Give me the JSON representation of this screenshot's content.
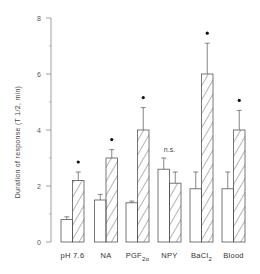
{
  "chart_data": {
    "type": "bar",
    "title": "",
    "xlabel": "",
    "ylabel": "Duration of response (T 1/2, min)",
    "ylim": [
      0,
      8
    ],
    "yticks": [
      0,
      2,
      4,
      6,
      8
    ],
    "grid": false,
    "legend": null,
    "categories": [
      "pH 7.6",
      "NA",
      "PGF2α",
      "NPY",
      "BaCl2",
      "Blood"
    ],
    "category_display": [
      {
        "main": "pH 7.6",
        "sub": ""
      },
      {
        "main": "NA",
        "sub": ""
      },
      {
        "main": "PGF",
        "sub": "2α"
      },
      {
        "main": "NPY",
        "sub": ""
      },
      {
        "main": "BaCl",
        "sub": "2"
      },
      {
        "main": "Blood",
        "sub": ""
      }
    ],
    "series": [
      {
        "name": "control (open)",
        "pattern": "open",
        "values": [
          0.8,
          1.5,
          1.4,
          2.6,
          1.9,
          1.9
        ],
        "errors": [
          0.1,
          0.2,
          0.06,
          0.4,
          0.6,
          0.6
        ]
      },
      {
        "name": "treated (hatched)",
        "pattern": "hatched",
        "values": [
          2.2,
          3.0,
          4.0,
          2.1,
          6.0,
          4.0
        ],
        "errors": [
          0.3,
          0.3,
          0.8,
          0.4,
          1.1,
          0.7
        ]
      }
    ],
    "annotations": [
      "*",
      "*",
      "*",
      "n.s.",
      "*",
      "*"
    ]
  },
  "colors": {
    "axis": "#888888",
    "bar_stroke": "#555555",
    "hatch": "#444444",
    "text": "#333333"
  }
}
